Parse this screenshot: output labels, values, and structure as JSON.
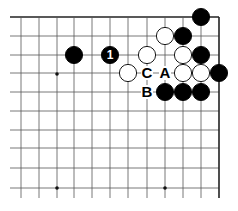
{
  "diagram": {
    "type": "go-board-corner",
    "corner": "top-right",
    "grid": {
      "cols_x": [
        21,
        39,
        57,
        74,
        92,
        110,
        128,
        147,
        165,
        183,
        201,
        219
      ],
      "rows_y": [
        17,
        36,
        55,
        73,
        92,
        111,
        130,
        148,
        168,
        188
      ],
      "left_extent": 10,
      "bottom_extent": 198,
      "line_color": "#555555",
      "edge_color": "#222222"
    },
    "star_points": [
      [
        57,
        74
      ],
      [
        57,
        188
      ],
      [
        165,
        188
      ]
    ],
    "stones": [
      {
        "color": "black",
        "x": 201,
        "y": 17
      },
      {
        "color": "white",
        "x": 165,
        "y": 36
      },
      {
        "color": "black",
        "x": 183,
        "y": 36
      },
      {
        "color": "black",
        "x": 74,
        "y": 55
      },
      {
        "color": "black",
        "x": 110,
        "y": 55,
        "label": "1"
      },
      {
        "color": "white",
        "x": 147,
        "y": 55
      },
      {
        "color": "white",
        "x": 183,
        "y": 55
      },
      {
        "color": "black",
        "x": 201,
        "y": 55
      },
      {
        "color": "white",
        "x": 128,
        "y": 73
      },
      {
        "color": "white",
        "x": 183,
        "y": 73
      },
      {
        "color": "white",
        "x": 201,
        "y": 73
      },
      {
        "color": "black",
        "x": 219,
        "y": 73
      },
      {
        "color": "black",
        "x": 165,
        "y": 92
      },
      {
        "color": "black",
        "x": 183,
        "y": 92
      },
      {
        "color": "black",
        "x": 201,
        "y": 92
      }
    ],
    "labels": [
      {
        "text": "C",
        "x": 147,
        "y": 73
      },
      {
        "text": "A",
        "x": 165,
        "y": 73
      },
      {
        "text": "B",
        "x": 147,
        "y": 92
      }
    ]
  }
}
